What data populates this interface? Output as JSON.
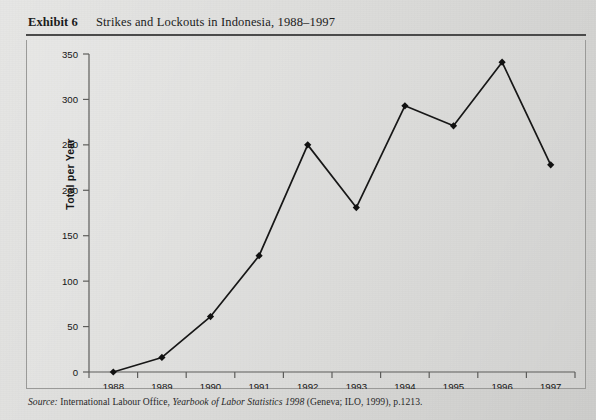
{
  "exhibit": {
    "label": "Exhibit 6",
    "title": "Strikes and Lockouts in Indonesia, 1988–1997"
  },
  "source": {
    "prefix": "Source:",
    "publisher": "International Labour Office,",
    "book": "Yearbook of Labor Statistics 1998",
    "imprint": "(Geneva; ILO, 1999), p.1213."
  },
  "colors": {
    "ink": "#1b1b1b",
    "line": "#171717",
    "marker": "#111111",
    "axis": "#5d5d5b",
    "frame": "#9a9a98",
    "paper": "#dcdcda",
    "rule": "#4a4a4a"
  },
  "chart_data": {
    "type": "line",
    "title": "Strikes and Lockouts in Indonesia, 1988–1997",
    "subtitle": "",
    "xlabel": "",
    "ylabel": "Total per Year",
    "categories": [
      "1988",
      "1989",
      "1990",
      "1991",
      "1992",
      "1993",
      "1994",
      "1995",
      "1996",
      "1997"
    ],
    "x": [
      1988,
      1989,
      1990,
      1991,
      1992,
      1993,
      1994,
      1995,
      1996,
      1997
    ],
    "values": [
      0,
      16,
      61,
      128,
      250,
      181,
      293,
      271,
      341,
      228
    ],
    "series": [
      {
        "name": "Total per Year",
        "values": [
          0,
          16,
          61,
          128,
          250,
          181,
          293,
          271,
          341,
          228
        ]
      }
    ],
    "ylim": [
      0,
      350
    ],
    "yticks": [
      0,
      50,
      100,
      150,
      200,
      250,
      300,
      350
    ],
    "ytick_labels": [
      "0",
      "50",
      "100",
      "150",
      "200",
      "250",
      "300",
      "350"
    ],
    "xtick_labels": [
      "1988",
      "1989",
      "1990",
      "1991",
      "1992",
      "1993",
      "1994",
      "1995",
      "1996",
      "1997"
    ],
    "grid": false,
    "legend": false,
    "legend_position": "none",
    "marker": "diamond",
    "line_color": "#171717",
    "annotations": []
  }
}
